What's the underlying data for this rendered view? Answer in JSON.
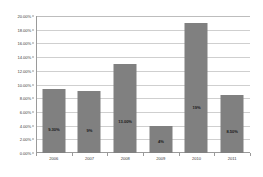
{
  "chart_data": {
    "type": "bar",
    "title": "",
    "xlabel": "",
    "ylabel": "",
    "categories": [
      "2006",
      "2007",
      "2008",
      "2009",
      "2010",
      "2011"
    ],
    "values": [
      9.3,
      9.0,
      13.0,
      4.0,
      19.0,
      8.5
    ],
    "data_labels": [
      "9.30%",
      "9%",
      "13.00%",
      "4%",
      "19%",
      "8.50%"
    ],
    "ylim": [
      0,
      20
    ],
    "ytick_values": [
      0,
      2,
      4,
      6,
      8,
      10,
      12,
      14,
      16,
      18,
      20
    ],
    "ytick_labels": [
      "0.00%",
      "2.00%",
      "4.00%",
      "6.00%",
      "8.00%",
      "10.00%",
      "12.00%",
      "14.00%",
      "16.00%",
      "18.00%",
      "20.00%"
    ],
    "grid": true,
    "legend": false,
    "colors": {
      "bar_fill": "#808080",
      "gridline": "#cfcfcf",
      "axis": "#9a9a9a",
      "plot_background": "#ffffff",
      "label_text": "#3a3a3a",
      "data_label_text": "#1a1a1a"
    }
  }
}
